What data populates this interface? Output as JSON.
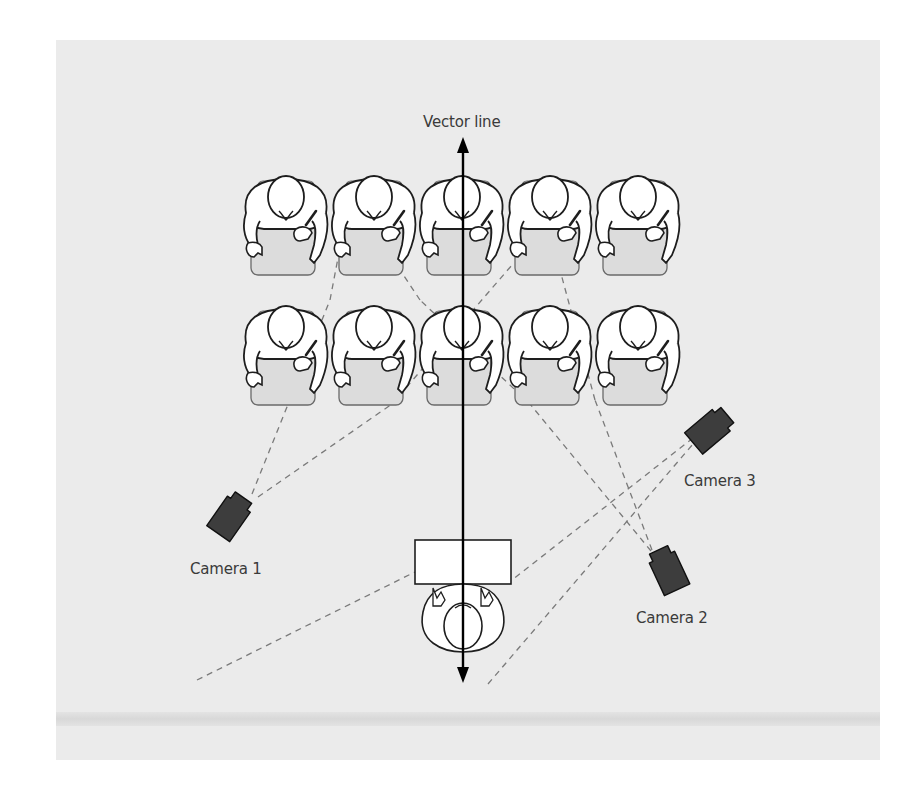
{
  "diagram": {
    "type": "classroom-camera-layout",
    "background_color": "#ebebeb",
    "vector_line": {
      "label": "Vector line",
      "x": 463,
      "y_top": 137,
      "y_bottom": 683
    },
    "students": {
      "rows": 2,
      "cols": 5,
      "col_x": [
        286,
        374,
        462,
        550,
        638
      ],
      "row_y": [
        215,
        345
      ],
      "desk_fill": "#dcdcdc",
      "outline_color": "#1e1e1e"
    },
    "teacher": {
      "desk": {
        "x": 415,
        "y": 540,
        "w": 96,
        "h": 44
      },
      "head_x": 463,
      "head_y": 622
    },
    "cameras": [
      {
        "id": "camera-1",
        "label": "Camera 1",
        "x": 232,
        "y": 514,
        "angle": 35,
        "label_x": 190,
        "label_y": 560
      },
      {
        "id": "camera-2",
        "label": "Camera 2",
        "x": 667,
        "y": 568,
        "angle": -25,
        "label_x": 636,
        "label_y": 609
      },
      {
        "id": "camera-3",
        "label": "Camera 3",
        "x": 712,
        "y": 428,
        "angle": 50,
        "label_x": 684,
        "label_y": 472
      }
    ],
    "sight_lines": [
      {
        "from": [
          252,
          494
        ],
        "to": [
          330,
          300
        ]
      },
      {
        "from": [
          258,
          497
        ],
        "to": [
          392,
          404
        ]
      },
      {
        "from": [
          197,
          680
        ],
        "to": [
          415,
          572
        ]
      },
      {
        "from": [
          652,
          550
        ],
        "to": [
          595,
          400
        ]
      },
      {
        "from": [
          651,
          551
        ],
        "to": [
          530,
          404
        ]
      },
      {
        "from": [
          488,
          684
        ],
        "to": [
          693,
          444
        ]
      },
      {
        "from": [
          693,
          438
        ],
        "to": [
          512,
          580
        ]
      },
      {
        "from": [
          595,
          400
        ],
        "to": [
          560,
          270
        ]
      },
      {
        "from": [
          530,
          404
        ],
        "to": [
          420,
          300
        ]
      },
      {
        "from": [
          392,
          404
        ],
        "to": [
          512,
          265
        ]
      },
      {
        "from": [
          330,
          300
        ],
        "to": [
          350,
          195
        ]
      },
      {
        "from": [
          420,
          300
        ],
        "to": [
          380,
          240
        ]
      }
    ]
  }
}
